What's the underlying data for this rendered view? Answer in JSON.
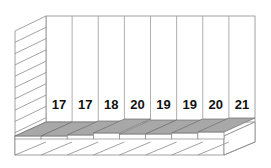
{
  "chart_data": {
    "type": "bar",
    "style": "3d",
    "title": "",
    "xlabel": "",
    "ylabel": "",
    "categories": [
      "1",
      "2",
      "3",
      "4",
      "5",
      "6",
      "7",
      "8"
    ],
    "values": [
      17,
      17,
      18,
      20,
      19,
      19,
      20,
      21
    ],
    "data_labels": [
      "17",
      "17",
      "18",
      "20",
      "19",
      "19",
      "20",
      "21"
    ],
    "grid": true,
    "legend": null,
    "colors": {
      "bar_top": "#a8a8a8",
      "wall": "#ffffff",
      "lines": "#8a8a8a"
    }
  }
}
